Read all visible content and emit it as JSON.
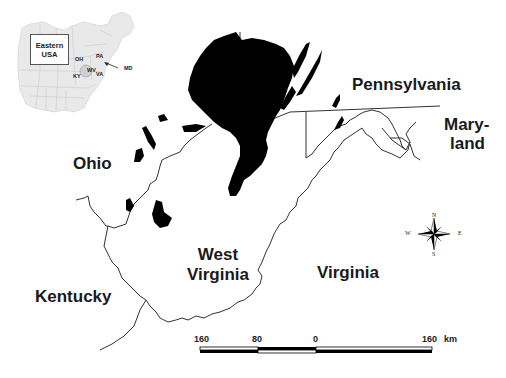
{
  "map": {
    "colors": {
      "background": "#ffffff",
      "coal_area": "#000000",
      "boundary": "#333333",
      "inset_fill": "#e8e8e8",
      "inset_lines": "#bbbbbb"
    },
    "state_labels": {
      "pennsylvania": "Pennsylvania",
      "maryland_line1": "Mary-",
      "maryland_line2": "land",
      "ohio": "Ohio",
      "west_virginia_line1": "West",
      "west_virginia_line2": "Virginia",
      "virginia": "Virginia",
      "kentucky": "Kentucky"
    },
    "inset": {
      "title_line1": "Eastern",
      "title_line2": "USA",
      "labels": {
        "oh": "OH",
        "pa": "PA",
        "wv": "WV",
        "va": "VA",
        "ky": "KY",
        "md": "MD"
      }
    },
    "compass": {
      "icon": "compass-rose-icon",
      "n": "N",
      "s": "S",
      "e": "E",
      "w": "W"
    },
    "scale_bar": {
      "ticks": [
        "160",
        "80",
        "0",
        "160"
      ],
      "unit": "km"
    }
  }
}
